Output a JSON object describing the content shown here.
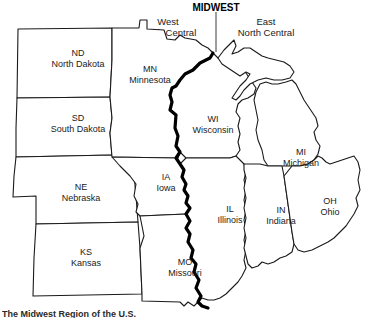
{
  "map": {
    "region_title": "MIDWEST",
    "divisions": [
      {
        "id": "west-north-central",
        "line1": "West",
        "line2": "North Central",
        "x": 168,
        "y": 27
      },
      {
        "id": "east-north-central",
        "line1": "East",
        "line2": "North Central",
        "x": 266,
        "y": 27
      }
    ],
    "divider": {
      "x": 216,
      "y1": 11,
      "y2": 52
    },
    "title_pos": {
      "x": 216,
      "y": 11
    },
    "states": [
      {
        "abbr": "ND",
        "name": "North Dakota",
        "x": 78,
        "y": 56,
        "division": "west-north-central"
      },
      {
        "abbr": "SD",
        "name": "South Dakota",
        "x": 78,
        "y": 121,
        "division": "west-north-central"
      },
      {
        "abbr": "MN",
        "name": "Minnesota",
        "x": 150,
        "y": 72,
        "division": "west-north-central"
      },
      {
        "abbr": "NE",
        "name": "Nebraska",
        "x": 81,
        "y": 190,
        "division": "west-north-central"
      },
      {
        "abbr": "IA",
        "name": "Iowa",
        "x": 166,
        "y": 180,
        "division": "west-north-central"
      },
      {
        "abbr": "KS",
        "name": "Kansas",
        "x": 86,
        "y": 255,
        "division": "west-north-central"
      },
      {
        "abbr": "MO",
        "name": "Missouri",
        "x": 185,
        "y": 265,
        "division": "west-north-central"
      },
      {
        "abbr": "WI",
        "name": "Wisconsin",
        "x": 213,
        "y": 122,
        "division": "east-north-central"
      },
      {
        "abbr": "MI",
        "name": "Michigan",
        "x": 301,
        "y": 155,
        "division": "east-north-central"
      },
      {
        "abbr": "IL",
        "name": "Illinois",
        "x": 230,
        "y": 212,
        "division": "east-north-central"
      },
      {
        "abbr": "IN",
        "name": "Indiana",
        "x": 281,
        "y": 213,
        "division": "east-north-central"
      },
      {
        "abbr": "OH",
        "name": "Ohio",
        "x": 330,
        "y": 204,
        "division": "east-north-central"
      }
    ],
    "colors": {
      "background": "#ffffff",
      "outline": "#1a1a1a",
      "river_divider": "#000000",
      "text": "#1a1a1a"
    }
  },
  "caption": {
    "text": "The Midwest Region of the U.S."
  }
}
